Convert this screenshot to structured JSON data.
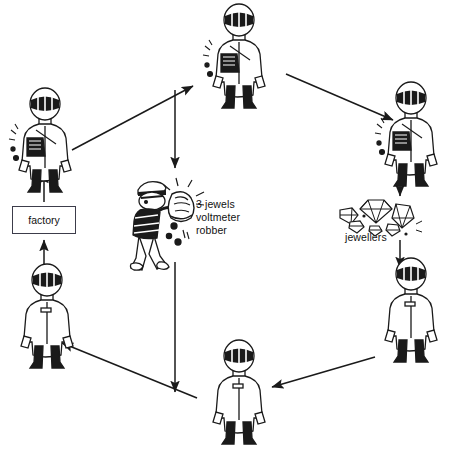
{
  "diagram": {
    "background": "#ffffff",
    "ink": "#1a1a1a",
    "labels": {
      "factory": "factory",
      "robber_line1": "3 jewels",
      "robber_line2": "voltmeter",
      "robber_line3": "robber",
      "jewellers": "jewellers"
    },
    "nodes": [
      {
        "id": "courier-top",
        "type": "courier-with-bag",
        "x": 196,
        "y": 2,
        "w": 86,
        "h": 112
      },
      {
        "id": "courier-left",
        "type": "courier-with-bag",
        "x": 2,
        "y": 86,
        "w": 86,
        "h": 112
      },
      {
        "id": "courier-right",
        "type": "courier-with-bag",
        "x": 368,
        "y": 80,
        "w": 86,
        "h": 112
      },
      {
        "id": "courier-lower-right",
        "type": "courier-empty",
        "x": 368,
        "y": 256,
        "w": 86,
        "h": 112
      },
      {
        "id": "courier-bottom",
        "type": "courier-empty",
        "x": 196,
        "y": 338,
        "w": 86,
        "h": 112
      },
      {
        "id": "courier-lower-left",
        "type": "courier-empty",
        "x": 4,
        "y": 262,
        "w": 86,
        "h": 112
      },
      {
        "id": "robber",
        "type": "robber-with-sack",
        "x": 126,
        "y": 170,
        "w": 84,
        "h": 104
      },
      {
        "id": "jewels",
        "type": "gem-cluster",
        "x": 330,
        "y": 194,
        "w": 94,
        "h": 46
      },
      {
        "id": "factory",
        "type": "box",
        "x": 12,
        "y": 206,
        "w": 64,
        "h": 28
      }
    ],
    "edges": [
      {
        "id": "e-left-to-top",
        "from": "courier-left",
        "to": "courier-top",
        "kind": "diagonal-up-right"
      },
      {
        "id": "e-top-to-right",
        "from": "courier-top",
        "to": "courier-right",
        "kind": "diagonal-down-right"
      },
      {
        "id": "e-top-to-robber",
        "from": "courier-top",
        "to": "robber",
        "kind": "vertical-down"
      },
      {
        "id": "e-right-to-jewels",
        "from": "courier-right",
        "to": "jewels",
        "kind": "vertical-down"
      },
      {
        "id": "e-jewels-to-lower-right",
        "from": "jewels",
        "to": "courier-lower-right",
        "kind": "vertical-down"
      },
      {
        "id": "e-lower-right-to-bottom",
        "from": "courier-lower-right",
        "to": "courier-bottom",
        "kind": "diagonal-down-left"
      },
      {
        "id": "e-bottom-to-lower-left",
        "from": "courier-bottom",
        "to": "courier-lower-left",
        "kind": "diagonal-up-left"
      },
      {
        "id": "e-robber-to-bottom",
        "from": "robber",
        "to": "courier-bottom",
        "kind": "vertical-down"
      },
      {
        "id": "e-lower-left-to-factory",
        "from": "courier-lower-left",
        "to": "factory",
        "kind": "vertical-up"
      },
      {
        "id": "e-factory-to-left",
        "from": "factory",
        "to": "courier-left",
        "kind": "vertical-up"
      }
    ]
  }
}
